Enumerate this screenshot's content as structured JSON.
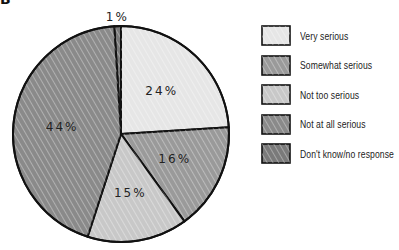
{
  "figure": {
    "letter": "B"
  },
  "chart_data": {
    "type": "pie",
    "title": "",
    "start_angle_deg": -3.6,
    "direction": "clockwise",
    "categories": [
      "Very serious",
      "Somewhat serious",
      "Not too serious",
      "Not at all serious",
      "Don't know/no response"
    ],
    "values": [
      24,
      16,
      15,
      44,
      1
    ],
    "labels": [
      "24%",
      "16%",
      "15%",
      "44%",
      "1%"
    ],
    "colors": [
      "#e6e6e6",
      "#9a9a9a",
      "#c8c8c8",
      "#8a8a8a",
      "#7a7a7a"
    ],
    "slice_order": [
      "Don't know/no response",
      "Very serious",
      "Somewhat serious",
      "Not too serious",
      "Not at all serious"
    ],
    "legend_position": "right",
    "style": "hand-drawn hatched"
  },
  "legend": {
    "items": [
      {
        "label": "Very serious",
        "color": "#e6e6e6"
      },
      {
        "label": "Somewhat serious",
        "color": "#9a9a9a"
      },
      {
        "label": "Not too serious",
        "color": "#c8c8c8"
      },
      {
        "label": "Not at all serious",
        "color": "#8a8a8a"
      },
      {
        "label": "Don't know/no response",
        "color": "#7a7a7a"
      }
    ]
  }
}
